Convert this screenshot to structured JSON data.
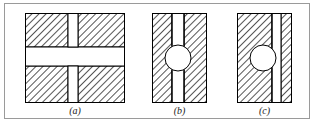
{
  "figure": {
    "caption_group": "three-part sectional diagram",
    "background_color": "#ffffff",
    "frame_color": "#9a9a9a",
    "outline_color": "#000000",
    "hatch_color": "#2b2b2b",
    "hatch_angle_deg": 45,
    "void_color": "#ffffff",
    "panels": [
      {
        "id": "a",
        "label": "(a)",
        "shape": "square-block",
        "description": "square hatched block with full-width horizontal slot and vertical slot forming a cross-shaped void",
        "x": 25,
        "y": 13,
        "width": 100,
        "height": 90,
        "voids": [
          {
            "kind": "horizontal-slot",
            "x": 25,
            "y": 47,
            "width": 100,
            "height": 19
          },
          {
            "kind": "vertical-slot",
            "x": 68,
            "y": 13,
            "width": 10,
            "height": 90
          }
        ],
        "circles": []
      },
      {
        "id": "b",
        "label": "(b)",
        "shape": "rectangular-block",
        "description": "tall hatched block with centered vertical slot and a round hole centered on the slot",
        "x": 152,
        "y": 13,
        "width": 55,
        "height": 90,
        "voids": [
          {
            "kind": "vertical-slot",
            "x": 172,
            "y": 13,
            "width": 12,
            "height": 90
          }
        ],
        "circles": [
          {
            "kind": "round-hole",
            "cx": 178,
            "cy": 58,
            "r": 13
          }
        ]
      },
      {
        "id": "c",
        "label": "(c)",
        "shape": "rectangular-block",
        "description": "tall hatched block with off-center vertical slot and a round hole offset to the left of the slot",
        "x": 237,
        "y": 13,
        "width": 55,
        "height": 90,
        "voids": [
          {
            "kind": "vertical-slot",
            "x": 272,
            "y": 13,
            "width": 9,
            "height": 90
          }
        ],
        "circles": [
          {
            "kind": "round-hole",
            "cx": 263,
            "cy": 58,
            "r": 13
          }
        ]
      }
    ],
    "labels": {
      "a": "(a)",
      "b": "(b)",
      "c": "(c)"
    }
  }
}
